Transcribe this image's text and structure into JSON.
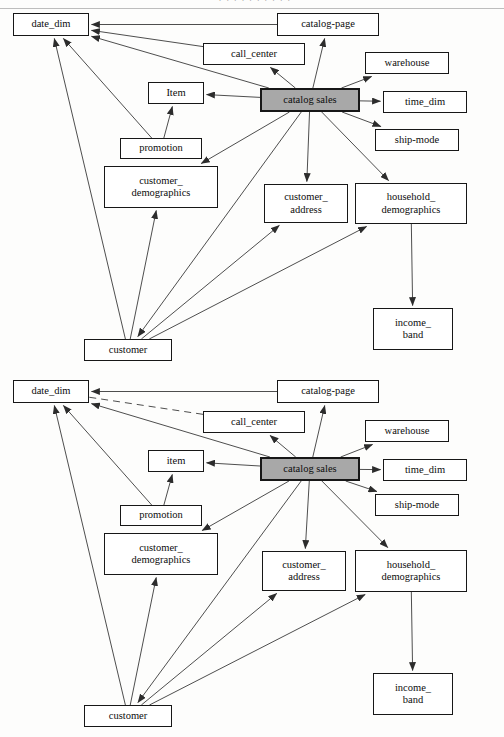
{
  "page": {
    "top_fragment_text": "· · · · · · · · · ·",
    "background_color": "#fdfdfc",
    "line_color": "#3a3a3a",
    "node_border_color": "#171717",
    "fact_fill_color": "#a8a8a8",
    "node_fill_color": "#ffffff"
  },
  "diagrams": [
    {
      "id": "diagram-top",
      "nodes": [
        {
          "id": "date_dim",
          "label": "date_dim",
          "x": 13,
          "y": 13,
          "w": 76,
          "h": 23,
          "fact": false
        },
        {
          "id": "catalog-page",
          "label": "catalog-page",
          "x": 277,
          "y": 13,
          "w": 102,
          "h": 23,
          "fact": false
        },
        {
          "id": "call_center",
          "label": "call_center",
          "x": 203,
          "y": 43,
          "w": 102,
          "h": 22,
          "fact": false
        },
        {
          "id": "warehouse",
          "label": "warehouse",
          "x": 365,
          "y": 52,
          "w": 84,
          "h": 22,
          "fact": false
        },
        {
          "id": "item",
          "label": "Item",
          "x": 148,
          "y": 82,
          "w": 56,
          "h": 22,
          "fact": false
        },
        {
          "id": "catalog-sales",
          "label": "catalog sales",
          "x": 260,
          "y": 88,
          "w": 100,
          "h": 24,
          "fact": true
        },
        {
          "id": "time_dim",
          "label": "time_dim",
          "x": 383,
          "y": 91,
          "w": 84,
          "h": 22,
          "fact": false
        },
        {
          "id": "promotion",
          "label": "promotion",
          "x": 120,
          "y": 138,
          "w": 82,
          "h": 21,
          "fact": false
        },
        {
          "id": "ship-mode",
          "label": "ship-mode",
          "x": 375,
          "y": 129,
          "w": 84,
          "h": 22,
          "fact": false
        },
        {
          "id": "customer_demographics",
          "label": "customer_\ndemographics",
          "x": 104,
          "y": 166,
          "w": 114,
          "h": 42,
          "fact": false
        },
        {
          "id": "customer_address",
          "label": "customer_\naddress",
          "x": 264,
          "y": 184,
          "w": 84,
          "h": 39,
          "fact": false
        },
        {
          "id": "household_demographics",
          "label": "household_\ndemographics",
          "x": 355,
          "y": 183,
          "w": 112,
          "h": 41,
          "fact": false
        },
        {
          "id": "income_band",
          "label": "income_\nband",
          "x": 373,
          "y": 308,
          "w": 80,
          "h": 42,
          "fact": false
        },
        {
          "id": "customer",
          "label": "customer",
          "x": 84,
          "y": 339,
          "w": 88,
          "h": 22,
          "fact": false
        }
      ],
      "edges": [
        {
          "from": "catalog-page",
          "to": "date_dim",
          "style": "solid",
          "arrow": "end"
        },
        {
          "from": "call_center",
          "to": "date_dim",
          "style": "solid",
          "arrow": "end"
        },
        {
          "from": "catalog-sales",
          "to": "date_dim",
          "style": "solid",
          "arrow": "end"
        },
        {
          "from": "catalog-sales",
          "to": "catalog-page",
          "style": "solid",
          "arrow": "end"
        },
        {
          "from": "catalog-sales",
          "to": "call_center",
          "style": "solid",
          "arrow": "end"
        },
        {
          "from": "catalog-sales",
          "to": "warehouse",
          "style": "solid",
          "arrow": "end"
        },
        {
          "from": "catalog-sales",
          "to": "item",
          "style": "solid",
          "arrow": "end"
        },
        {
          "from": "catalog-sales",
          "to": "time_dim",
          "style": "solid",
          "arrow": "end"
        },
        {
          "from": "catalog-sales",
          "to": "ship-mode",
          "style": "solid",
          "arrow": "end"
        },
        {
          "from": "catalog-sales",
          "to": "customer_demographics",
          "style": "solid",
          "arrow": "end"
        },
        {
          "from": "catalog-sales",
          "to": "customer_address",
          "style": "solid",
          "arrow": "end"
        },
        {
          "from": "catalog-sales",
          "to": "household_demographics",
          "style": "solid",
          "arrow": "end"
        },
        {
          "from": "catalog-sales",
          "to": "customer",
          "style": "solid",
          "arrow": "end"
        },
        {
          "from": "promotion",
          "to": "date_dim",
          "style": "solid",
          "arrow": "end"
        },
        {
          "from": "promotion",
          "to": "item",
          "style": "solid",
          "arrow": "end"
        },
        {
          "from": "customer",
          "to": "date_dim",
          "style": "solid",
          "arrow": "end"
        },
        {
          "from": "customer",
          "to": "customer_demographics",
          "style": "solid",
          "arrow": "end"
        },
        {
          "from": "customer",
          "to": "customer_address",
          "style": "solid",
          "arrow": "end"
        },
        {
          "from": "customer",
          "to": "household_demographics",
          "style": "solid",
          "arrow": "end"
        },
        {
          "from": "household_demographics",
          "to": "income_band",
          "style": "solid",
          "arrow": "end"
        }
      ]
    },
    {
      "id": "diagram-bottom",
      "nodes": [
        {
          "id": "date_dim",
          "label": "date_dim",
          "x": 13,
          "y": 380,
          "w": 76,
          "h": 23,
          "fact": false
        },
        {
          "id": "catalog-page",
          "label": "catalog-page",
          "x": 277,
          "y": 380,
          "w": 102,
          "h": 23,
          "fact": false
        },
        {
          "id": "call_center",
          "label": "call_center",
          "x": 203,
          "y": 411,
          "w": 102,
          "h": 22,
          "fact": false
        },
        {
          "id": "warehouse",
          "label": "warehouse",
          "x": 365,
          "y": 420,
          "w": 84,
          "h": 22,
          "fact": false
        },
        {
          "id": "item",
          "label": "item",
          "x": 148,
          "y": 450,
          "w": 56,
          "h": 22,
          "fact": false
        },
        {
          "id": "catalog-sales",
          "label": "catalog sales",
          "x": 260,
          "y": 457,
          "w": 100,
          "h": 24,
          "fact": true
        },
        {
          "id": "time_dim",
          "label": "time_dim",
          "x": 383,
          "y": 459,
          "w": 84,
          "h": 22,
          "fact": false
        },
        {
          "id": "ship-mode",
          "label": "ship-mode",
          "x": 375,
          "y": 494,
          "w": 84,
          "h": 22,
          "fact": false
        },
        {
          "id": "promotion",
          "label": "promotion",
          "x": 120,
          "y": 505,
          "w": 82,
          "h": 21,
          "fact": false
        },
        {
          "id": "customer_demographics",
          "label": "customer_\ndemographics",
          "x": 104,
          "y": 533,
          "w": 114,
          "h": 42,
          "fact": false
        },
        {
          "id": "customer_address",
          "label": "customer_\naddress",
          "x": 262,
          "y": 551,
          "w": 84,
          "h": 40,
          "fact": false
        },
        {
          "id": "household_demographics",
          "label": "household_\ndemographics",
          "x": 355,
          "y": 550,
          "w": 112,
          "h": 42,
          "fact": false
        },
        {
          "id": "income_band",
          "label": "income_\nband",
          "x": 373,
          "y": 673,
          "w": 80,
          "h": 42,
          "fact": false
        },
        {
          "id": "customer",
          "label": "customer",
          "x": 84,
          "y": 705,
          "w": 88,
          "h": 22,
          "fact": false
        }
      ],
      "edges": [
        {
          "from": "catalog-page",
          "to": "date_dim",
          "style": "solid",
          "arrow": "end"
        },
        {
          "from": "call_center",
          "to": "date_dim",
          "style": "dashed",
          "arrow": "none"
        },
        {
          "from": "catalog-sales",
          "to": "date_dim",
          "style": "solid",
          "arrow": "end"
        },
        {
          "from": "catalog-sales",
          "to": "catalog-page",
          "style": "solid",
          "arrow": "end"
        },
        {
          "from": "catalog-sales",
          "to": "call_center",
          "style": "solid",
          "arrow": "end"
        },
        {
          "from": "catalog-sales",
          "to": "warehouse",
          "style": "solid",
          "arrow": "end"
        },
        {
          "from": "catalog-sales",
          "to": "item",
          "style": "solid",
          "arrow": "end"
        },
        {
          "from": "catalog-sales",
          "to": "time_dim",
          "style": "solid",
          "arrow": "end"
        },
        {
          "from": "catalog-sales",
          "to": "ship-mode",
          "style": "solid",
          "arrow": "end"
        },
        {
          "from": "catalog-sales",
          "to": "customer_demographics",
          "style": "solid",
          "arrow": "end"
        },
        {
          "from": "catalog-sales",
          "to": "customer_address",
          "style": "solid",
          "arrow": "end"
        },
        {
          "from": "catalog-sales",
          "to": "household_demographics",
          "style": "solid",
          "arrow": "end"
        },
        {
          "from": "catalog-sales",
          "to": "customer",
          "style": "solid",
          "arrow": "end"
        },
        {
          "from": "promotion",
          "to": "date_dim",
          "style": "solid",
          "arrow": "end"
        },
        {
          "from": "promotion",
          "to": "item",
          "style": "solid",
          "arrow": "end"
        },
        {
          "from": "customer",
          "to": "date_dim",
          "style": "solid",
          "arrow": "end"
        },
        {
          "from": "customer",
          "to": "customer_demographics",
          "style": "solid",
          "arrow": "end"
        },
        {
          "from": "customer",
          "to": "customer_address",
          "style": "solid",
          "arrow": "end"
        },
        {
          "from": "customer",
          "to": "household_demographics",
          "style": "solid",
          "arrow": "end"
        },
        {
          "from": "household_demographics",
          "to": "income_band",
          "style": "solid",
          "arrow": "end"
        }
      ]
    }
  ]
}
